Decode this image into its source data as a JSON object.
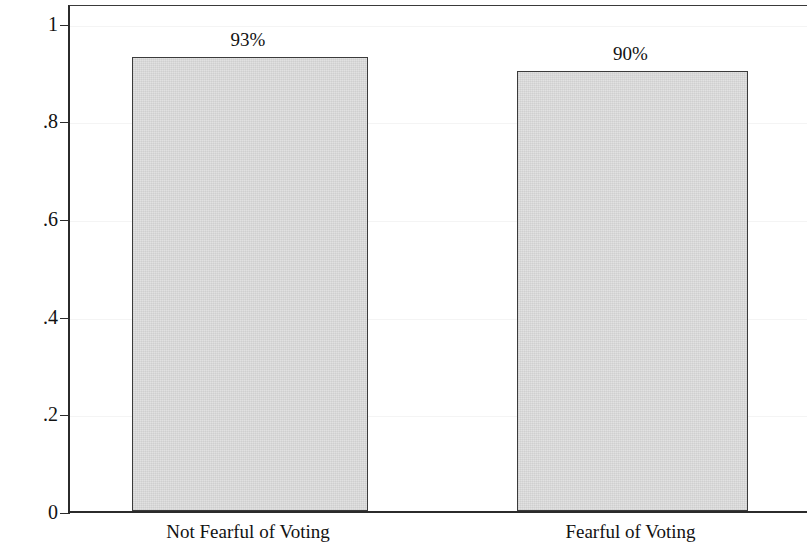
{
  "chart_data": {
    "type": "bar",
    "title": "",
    "subtitle": "",
    "xlabel": "",
    "ylabel": "Intend to Vote (Share)",
    "categories": [
      "Not Fearful of Voting",
      "Fearful of Voting"
    ],
    "values": [
      0.93,
      0.9
    ],
    "data_labels": [
      "93%",
      "90%"
    ],
    "ylim": [
      0,
      1.04
    ],
    "ytick_values": [
      0,
      0.2,
      0.4,
      0.6,
      0.8,
      1
    ],
    "ytick_labels": [
      "0",
      ".2",
      ".4",
      ".6",
      ".8",
      "1"
    ],
    "grid": true,
    "legend": "none",
    "bar_fill_color": "#dedede",
    "bar_border_color": "#3b3b3b",
    "axis_color": "#2b2b2b",
    "gridline_color": "#f4f4f4",
    "background_color": "#ffffff"
  }
}
